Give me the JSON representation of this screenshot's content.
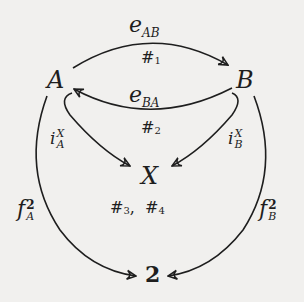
{
  "diagram": {
    "nodes": {
      "A": "A",
      "B": "B",
      "X": "X",
      "two": "2"
    },
    "edges": {
      "e_AB": {
        "base": "e",
        "sub": "AB",
        "note": "#",
        "note_sub": "1"
      },
      "e_BA": {
        "base": "e",
        "sub": "BA",
        "note": "#",
        "note_sub": "2"
      },
      "i_A": {
        "base": "i",
        "sup": "X",
        "sub": "A"
      },
      "i_B": {
        "base": "i",
        "sup": "X",
        "sub": "B"
      },
      "f_A": {
        "base": "f",
        "sup": "2",
        "sub": "A"
      },
      "f_B": {
        "base": "f",
        "sup": "2",
        "sub": "B"
      }
    },
    "annotations": {
      "x_notes": {
        "h1": "#",
        "s1": "3",
        "sep": ",",
        "h2": "#",
        "s2": "4"
      }
    },
    "colors": {
      "background": "#f1f0ee",
      "ink": "#1e1e1e"
    }
  }
}
